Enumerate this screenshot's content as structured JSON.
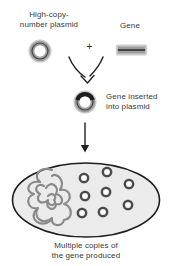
{
  "diagram": {
    "labels": {
      "plasmid_line1": "High-copy-",
      "plasmid_line2": "number plasmid",
      "gene": "Gene",
      "plus": "+",
      "inserted_line1": "Gene inserted",
      "inserted_line2": "into plasmid",
      "caption_line1": "Multiple copies of",
      "caption_line2": "the gene produced"
    },
    "colors": {
      "outline": "#1e1e1e",
      "ring_gray": "#9c9c9c",
      "halo_gray": "#cdcdcd",
      "dark_segment": "#1e1e1e",
      "cell_fill": "#ebebeb",
      "chromosome_gray": "#8a8a8a",
      "copy_ring": "#4a4a4a",
      "text": "#3a3a3a",
      "background": "#ffffff"
    },
    "cell": {
      "plasmid_copy_count": 8,
      "plasmid_copies": [
        {
          "x": 84,
          "y": 178
        },
        {
          "x": 107,
          "y": 172
        },
        {
          "x": 129,
          "y": 184
        },
        {
          "x": 85,
          "y": 196
        },
        {
          "x": 106,
          "y": 192
        },
        {
          "x": 128,
          "y": 205
        },
        {
          "x": 82,
          "y": 213
        },
        {
          "x": 103,
          "y": 212
        }
      ]
    }
  }
}
